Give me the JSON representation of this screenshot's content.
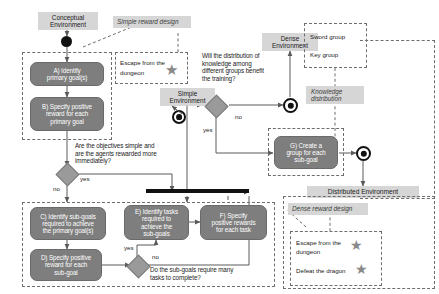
{
  "diagram": {
    "type": "uml-activity-diagram",
    "colors": {
      "activity_fill": "#7e7e7e",
      "activity_text": "#ffffff",
      "label_fill": "#d6d6d6",
      "decision_fill": "#9a9a9a",
      "node_stroke": "#111111",
      "dashed_stroke": "#6e6e6e",
      "star": "#8a8a8a"
    }
  },
  "environments": {
    "conceptual": "Conceptual\nEnvironment",
    "conceptual_line1": "Conceptual",
    "conceptual_line2": "Environment",
    "simple_line1": "Simple",
    "simple_line2": "Environment",
    "dense_line1": "Dense",
    "dense_line2": "Environment",
    "distributed": "Distributed Environment"
  },
  "reward_designs": {
    "simple": "Simple reward design",
    "dense": "Dense reward design",
    "knowledge_line1": "Knowledge",
    "knowledge_line2": "distribution"
  },
  "activities": {
    "a": {
      "id": "A",
      "line1": "A) Identify",
      "line2": "primary goal(s)"
    },
    "b": {
      "id": "B",
      "line1": "B) Specify positive",
      "line2": "reward for each",
      "line3": "primary goal"
    },
    "c": {
      "id": "C",
      "line1": "C) Identify sub-goals",
      "line2": "required to achieve",
      "line3": "the primary goal(s)"
    },
    "d": {
      "id": "D",
      "line1": "D) Specify positive",
      "line2": "reward for each",
      "line3": "sub-goal"
    },
    "e": {
      "id": "E",
      "line1": "E) Identify tasks",
      "line2": "required to",
      "line3": "achieve the",
      "line4": "sub-goals"
    },
    "f": {
      "id": "F",
      "line1": "F) Specify",
      "line2": "positive rewards",
      "line3": "for each task"
    },
    "g": {
      "id": "G",
      "line1": "G) Create a",
      "line2": "group for each",
      "line3": "sub-goal"
    }
  },
  "decisions": {
    "objectives": {
      "line1": "Are the objectives simple and",
      "line2": "are the agents rewarded more",
      "line3": "immediately?",
      "yes": "yes",
      "no": "no"
    },
    "subgoals": {
      "line1": "Do the sub-goals require many",
      "line2": "tasks to complete?",
      "yes": "yes",
      "no": "no"
    },
    "knowledge": {
      "line1": "Will the distribution of",
      "line2": "knowledge among",
      "line3": "different groups benefit",
      "line4": "the training?",
      "yes": "yes",
      "no": "no"
    }
  },
  "notes": {
    "simple_reward_items": [
      {
        "text": "Escape from the",
        "text2": "dungeon",
        "star": "★"
      }
    ],
    "dense_reward_items": [
      {
        "text": "Escape from the",
        "text2": "dungeon",
        "star": "★"
      },
      {
        "text": "Defeat the dragon",
        "text2": "",
        "star": "★"
      }
    ],
    "groups": [
      {
        "label": "Sword group"
      },
      {
        "label": "Key group"
      }
    ]
  }
}
